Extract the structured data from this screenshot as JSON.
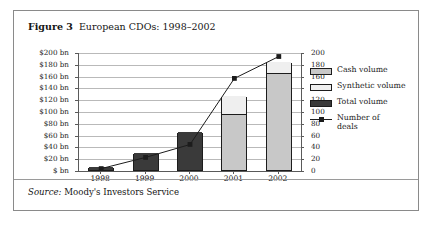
{
  "figure": {
    "label": "Figure 3",
    "caption": "European CDOs: 1998–2002",
    "source_word": "Source:",
    "source_text": " Moody's Investors Service"
  },
  "colors": {
    "cash_volume": "#c8c8c8",
    "synthetic_volume": "#efefef",
    "total_volume": "#3a3a3a",
    "line": "#1c1c1c",
    "gridline": "#b9b9b9",
    "axis": "#5a5a5a",
    "border": "#8a8a8a"
  },
  "legend": {
    "position": "right",
    "items": [
      {
        "label": "Cash volume",
        "type": "swatch",
        "fill": "#c8c8c8"
      },
      {
        "label": "Synthetic volume",
        "type": "swatch",
        "fill": "#efefef"
      },
      {
        "label": "Total volume",
        "type": "swatch",
        "fill": "#3a3a3a"
      },
      {
        "label": "Number of deals",
        "type": "line-marker",
        "fill": "#1c1c1c"
      }
    ]
  },
  "chart_data": {
    "type": "bar",
    "title": "European CDOs: 1998–2002",
    "subtitle": "",
    "xlabel": "",
    "ylabel": "",
    "categories": [
      "1998",
      "1999",
      "2000",
      "2001",
      "2002"
    ],
    "grid": true,
    "stacked": true,
    "left_axis": {
      "label": "",
      "ylim": [
        0,
        200
      ],
      "tick_step": 20,
      "tick_labels": [
        "$ bn",
        "$20 bn",
        "$40 bn",
        "$60 bn",
        "$80 bn",
        "$100 bn",
        "$120 bn",
        "$140 bn",
        "$160 bn",
        "$180 bn",
        "$200 bn"
      ],
      "tick_values": [
        0,
        20,
        40,
        60,
        80,
        100,
        120,
        140,
        160,
        180,
        200
      ]
    },
    "right_axis": {
      "label": "",
      "ylim": [
        0,
        200
      ],
      "tick_step": 20,
      "tick_labels": [
        "0",
        "20",
        "40",
        "60",
        "80",
        "100",
        "120",
        "140",
        "160",
        "180",
        "200"
      ],
      "tick_values": [
        0,
        20,
        40,
        60,
        80,
        100,
        120,
        140,
        160,
        180,
        200
      ]
    },
    "series": [
      {
        "name": "Total volume",
        "kind": "bar-segment",
        "axis": "left",
        "values": [
          5,
          29,
          64,
          0,
          0
        ]
      },
      {
        "name": "Cash volume",
        "kind": "bar-segment",
        "axis": "left",
        "values": [
          0,
          0,
          0,
          95,
          165
        ]
      },
      {
        "name": "Synthetic volume",
        "kind": "bar-segment",
        "axis": "left",
        "values": [
          0,
          0,
          0,
          30,
          18
        ]
      },
      {
        "name": "Number of deals",
        "kind": "line",
        "axis": "right",
        "values": [
          4,
          23,
          45,
          157,
          194
        ]
      }
    ],
    "bar_totals": [
      5,
      29,
      64,
      125,
      183
    ]
  }
}
